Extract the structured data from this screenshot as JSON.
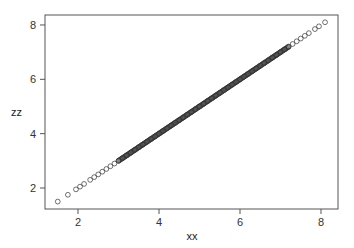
{
  "chart_data": {
    "type": "scatter",
    "title": "",
    "xlabel": "xx",
    "ylabel": "zz",
    "xlim": [
      1.2,
      8.4
    ],
    "ylim": [
      1.2,
      8.4
    ],
    "x_ticks": [
      2,
      4,
      6,
      8
    ],
    "y_ticks": [
      2,
      4,
      6,
      8
    ],
    "grid": false,
    "legend": null,
    "marker": "open-circle",
    "relationship": "zz = xx (points lie on identity line)",
    "series": [
      {
        "name": "zz vs xx",
        "x": [
          1.5,
          1.75,
          1.95,
          2.05,
          2.15,
          2.3,
          2.4,
          2.5,
          2.6,
          2.7,
          2.8,
          2.9,
          3.0,
          3.1,
          3.2,
          3.3,
          3.4,
          3.5,
          3.6,
          3.7,
          3.8,
          3.9,
          4.0,
          4.1,
          4.2,
          4.3,
          4.4,
          4.5,
          4.6,
          4.7,
          4.8,
          4.9,
          5.0,
          5.1,
          5.2,
          5.3,
          5.4,
          5.5,
          5.6,
          5.7,
          5.8,
          5.9,
          6.0,
          6.1,
          6.2,
          6.3,
          6.4,
          6.5,
          6.6,
          6.7,
          6.8,
          6.9,
          7.0,
          7.1,
          7.2,
          7.3,
          7.4,
          7.5,
          7.6,
          7.7,
          7.85,
          7.95,
          8.1
        ],
        "y": [
          1.5,
          1.75,
          1.95,
          2.05,
          2.15,
          2.3,
          2.4,
          2.5,
          2.6,
          2.7,
          2.8,
          2.9,
          3.0,
          3.1,
          3.2,
          3.3,
          3.4,
          3.5,
          3.6,
          3.7,
          3.8,
          3.9,
          4.0,
          4.1,
          4.2,
          4.3,
          4.4,
          4.5,
          4.6,
          4.7,
          4.8,
          4.9,
          5.0,
          5.1,
          5.2,
          5.3,
          5.4,
          5.5,
          5.6,
          5.7,
          5.8,
          5.9,
          6.0,
          6.1,
          6.2,
          6.3,
          6.4,
          6.5,
          6.6,
          6.7,
          6.8,
          6.9,
          7.0,
          7.1,
          7.2,
          7.3,
          7.4,
          7.5,
          7.6,
          7.7,
          7.85,
          7.95,
          8.1
        ]
      }
    ]
  },
  "axes": {
    "x_title": "xx",
    "y_title": "zz",
    "x_tick_labels": [
      "2",
      "4",
      "6",
      "8"
    ],
    "y_tick_labels": [
      "2",
      "4",
      "6",
      "8"
    ]
  }
}
